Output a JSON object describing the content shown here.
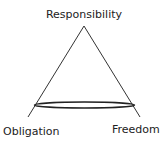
{
  "diagram": {
    "type": "triangle",
    "labels": {
      "top": "Responsibility",
      "bottom_left": "Obligation",
      "bottom_right": "Freedom"
    },
    "colors": {
      "stroke": "#222222",
      "text": "#222222",
      "background": "#ffffff"
    }
  }
}
